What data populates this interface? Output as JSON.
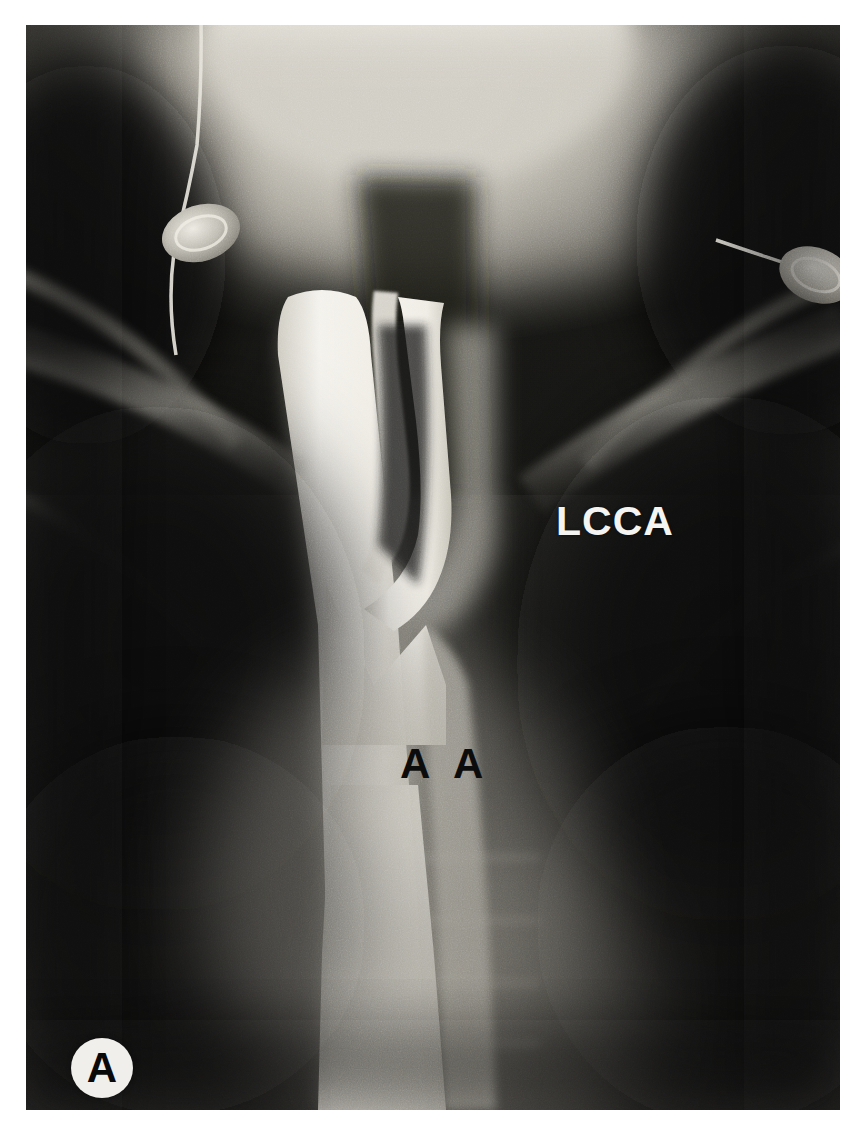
{
  "figure": {
    "modality": "angiogram",
    "panel_letter": "A",
    "view": "frontal",
    "background_color": "#ffffff",
    "plate_color": "#0d0d0d"
  },
  "annotations": [
    {
      "id": "lcca",
      "text": "LCCA",
      "meaning": "left common carotid artery",
      "color": "#f4f4f2",
      "style": "white-bold",
      "x": 556,
      "y": 498
    },
    {
      "id": "aa",
      "text": "A A",
      "meaning": "ascending aorta",
      "color": "#0c0c0c",
      "style": "black-bold",
      "x": 400,
      "y": 740
    }
  ],
  "panel_badge": {
    "letter": "A",
    "shape": "circle",
    "fill": "#f0efec",
    "text_color": "#0a0a0a"
  },
  "structures": [
    {
      "name": "skull-base-mandible",
      "tone": "bright"
    },
    {
      "name": "cervical-soft-tissue",
      "tone": "mid"
    },
    {
      "name": "aortic-arch-contrast-column",
      "tone": "very-bright"
    },
    {
      "name": "left-common-carotid-artery",
      "tone": "very-bright"
    },
    {
      "name": "left-clavicle",
      "tone": "bright"
    },
    {
      "name": "right-clavicle",
      "tone": "bright"
    },
    {
      "name": "left-lung-field",
      "tone": "dark"
    },
    {
      "name": "right-lung-field",
      "tone": "dark"
    },
    {
      "name": "thoracic-vertebral-bodies",
      "tone": "mid"
    },
    {
      "name": "ecg-electrode-left",
      "tone": "bright"
    },
    {
      "name": "ecg-electrode-right",
      "tone": "bright"
    },
    {
      "name": "ecg-lead-wire-left",
      "tone": "bright"
    },
    {
      "name": "ecg-lead-wire-right",
      "tone": "bright"
    }
  ]
}
